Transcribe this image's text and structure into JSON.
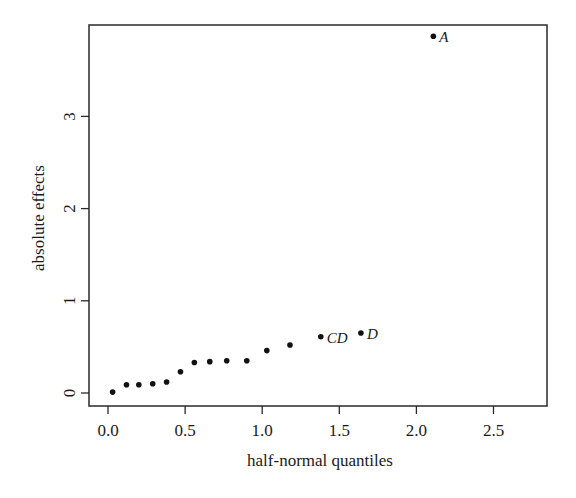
{
  "chart_data": {
    "type": "scatter",
    "title": "",
    "xlabel": "half-normal quantiles",
    "ylabel": "absolute effects",
    "xlim": [
      -0.1,
      2.85
    ],
    "ylim": [
      -0.14,
      4.0
    ],
    "grid": false,
    "legend": null,
    "x_ticks": [
      0.0,
      0.5,
      1.0,
      1.5,
      2.0,
      2.5
    ],
    "x_tick_labels": [
      "0.0",
      "0.5",
      "1.0",
      "1.5",
      "2.0",
      "2.5"
    ],
    "y_ticks": [
      0,
      1,
      2,
      3
    ],
    "y_tick_labels": [
      "0",
      "1",
      "2",
      "3"
    ],
    "points": [
      {
        "x": 0.03,
        "y": 0.01,
        "label": ""
      },
      {
        "x": 0.12,
        "y": 0.09,
        "label": ""
      },
      {
        "x": 0.2,
        "y": 0.09,
        "label": ""
      },
      {
        "x": 0.29,
        "y": 0.1,
        "label": ""
      },
      {
        "x": 0.38,
        "y": 0.12,
        "label": ""
      },
      {
        "x": 0.47,
        "y": 0.23,
        "label": ""
      },
      {
        "x": 0.56,
        "y": 0.33,
        "label": ""
      },
      {
        "x": 0.66,
        "y": 0.34,
        "label": ""
      },
      {
        "x": 0.77,
        "y": 0.35,
        "label": ""
      },
      {
        "x": 0.9,
        "y": 0.35,
        "label": ""
      },
      {
        "x": 1.03,
        "y": 0.46,
        "label": ""
      },
      {
        "x": 1.18,
        "y": 0.52,
        "label": ""
      },
      {
        "x": 1.38,
        "y": 0.61,
        "label": "CD"
      },
      {
        "x": 1.64,
        "y": 0.65,
        "label": "D"
      },
      {
        "x": 2.11,
        "y": 3.87,
        "label": "A"
      }
    ]
  },
  "colors": {
    "frame": "#2a2a2a",
    "point": "#111111",
    "text": "#1a1a1a"
  }
}
